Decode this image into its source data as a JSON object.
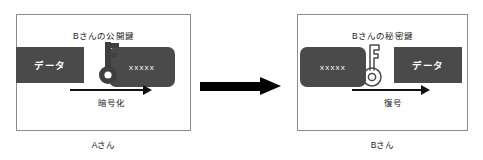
{
  "diagram": {
    "colors": {
      "block_fill": "#4a4a4a",
      "block_text": "#ffffff",
      "panel_border": "#8c8c8c",
      "arrow": "#000000",
      "text": "#1a1a1a"
    },
    "panels": [
      {
        "id": "sender",
        "key_label": "Bさんの公開鍵",
        "key_icon": "key-solid-icon",
        "input_block": "データ",
        "output_block": "xxxxx",
        "operation_label": "暗号化",
        "arrow_icon": "arrow-right-icon",
        "person_label": "Aさん"
      },
      {
        "id": "receiver",
        "key_label": "Bさんの秘密鍵",
        "key_icon": "key-outline-icon",
        "input_block": "xxxxx",
        "output_block": "データ",
        "operation_label": "復号",
        "arrow_icon": "arrow-right-icon",
        "person_label": "Bさん"
      }
    ],
    "transfer_arrow": {
      "icon": "big-arrow-right-icon",
      "label": ""
    }
  }
}
